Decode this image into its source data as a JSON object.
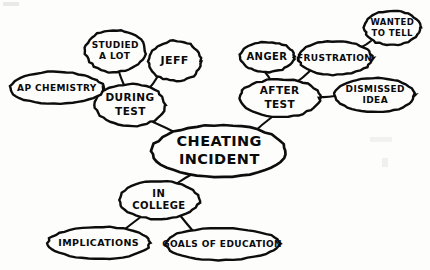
{
  "diagram": {
    "type": "mind-map",
    "style": "hand-drawn",
    "background_color": "#fdfdfc",
    "ink_color": "#0d0d0d",
    "center": {
      "id": "cheating-incident",
      "label": "CHEATING INCIDENT",
      "lines": [
        "CHEATING",
        "INCIDENT"
      ],
      "cx": 219,
      "cy": 151,
      "rx": 67,
      "ry": 26,
      "font_size": 14.5
    },
    "nodes": [
      {
        "id": "during-test",
        "label": "DURING TEST",
        "lines": [
          "DURING",
          "TEST"
        ],
        "cx": 130,
        "cy": 105,
        "rx": 35,
        "ry": 21,
        "font_size": 10.5
      },
      {
        "id": "after-test",
        "label": "AFTER TEST",
        "lines": [
          "AFTER",
          "TEST"
        ],
        "cx": 280,
        "cy": 98,
        "rx": 40,
        "ry": 19,
        "font_size": 10.5
      },
      {
        "id": "in-college",
        "label": "IN COLLEGE",
        "lines": [
          "IN",
          "COLLEGE"
        ],
        "cx": 159,
        "cy": 200,
        "rx": 40,
        "ry": 19,
        "font_size": 10
      },
      {
        "id": "ap-chemistry",
        "label": "AP CHEMISTRY",
        "lines": [
          "AP CHEMISTRY"
        ],
        "cx": 57,
        "cy": 88,
        "rx": 47,
        "ry": 16,
        "font_size": 9
      },
      {
        "id": "studied-a-lot",
        "label": "STUDIED A LOT",
        "lines": [
          "STUDIED",
          "A LOT"
        ],
        "cx": 115,
        "cy": 51,
        "rx": 30,
        "ry": 21,
        "font_size": 9
      },
      {
        "id": "jeff",
        "label": "JEFF",
        "lines": [
          "JEFF"
        ],
        "cx": 175,
        "cy": 61,
        "rx": 26,
        "ry": 20,
        "font_size": 11
      },
      {
        "id": "anger",
        "label": "ANGER",
        "lines": [
          "ANGER"
        ],
        "cx": 267,
        "cy": 57,
        "rx": 27,
        "ry": 15,
        "font_size": 10
      },
      {
        "id": "frustration",
        "label": "FRUSTRATION",
        "lines": [
          "FRUSTRATION"
        ],
        "cx": 335,
        "cy": 58,
        "rx": 37,
        "ry": 17,
        "font_size": 9
      },
      {
        "id": "wanted-to-tell",
        "label": "WANTED TO TELL",
        "lines": [
          "WANTED",
          "TO TELL"
        ],
        "cx": 392,
        "cy": 28,
        "rx": 28,
        "ry": 17,
        "font_size": 8.5
      },
      {
        "id": "dismissed-idea",
        "label": "DISMISSED IDEA",
        "lines": [
          "DISMISSED",
          "IDEA"
        ],
        "cx": 375,
        "cy": 95,
        "rx": 40,
        "ry": 17,
        "font_size": 9
      },
      {
        "id": "implications",
        "label": "IMPLICATIONS",
        "lines": [
          "IMPLICATIONS"
        ],
        "cx": 99,
        "cy": 243,
        "rx": 51,
        "ry": 16,
        "font_size": 9.5
      },
      {
        "id": "goals-of-education",
        "label": "GOALS OF EDUCATION",
        "lines": [
          "GOALS OF EDUCATION"
        ],
        "cx": 222,
        "cy": 244,
        "rx": 57,
        "ry": 16,
        "font_size": 9
      }
    ],
    "edges": [
      {
        "from": "during-test",
        "to": "cheating-incident",
        "x1": 153,
        "y1": 122,
        "x2": 178,
        "y2": 134
      },
      {
        "from": "after-test",
        "to": "cheating-incident",
        "x1": 272,
        "y1": 117,
        "x2": 253,
        "y2": 133
      },
      {
        "from": "in-college",
        "to": "cheating-incident",
        "x1": 176,
        "y1": 184,
        "x2": 196,
        "y2": 172
      },
      {
        "from": "ap-chemistry",
        "to": "during-test",
        "x1": 103,
        "y1": 92,
        "x2": 101,
        "y2": 100
      },
      {
        "from": "studied-a-lot",
        "to": "during-test",
        "x1": 119,
        "y1": 72,
        "x2": 124,
        "y2": 85
      },
      {
        "from": "jeff",
        "to": "during-test",
        "x1": 158,
        "y1": 76,
        "x2": 147,
        "y2": 91
      },
      {
        "from": "anger",
        "to": "after-test",
        "x1": 265,
        "y1": 72,
        "x2": 271,
        "y2": 81
      },
      {
        "from": "frustration",
        "to": "after-test",
        "x1": 311,
        "y1": 70,
        "x2": 294,
        "y2": 84
      },
      {
        "from": "wanted-to-tell",
        "to": "frustration",
        "x1": 371,
        "y1": 41,
        "x2": 360,
        "y2": 48
      },
      {
        "from": "dismissed-idea",
        "to": "after-test",
        "x1": 335,
        "y1": 96,
        "x2": 320,
        "y2": 97
      },
      {
        "from": "implications",
        "to": "in-college",
        "x1": 125,
        "y1": 229,
        "x2": 142,
        "y2": 216
      },
      {
        "from": "goals-of-education",
        "to": "in-college",
        "x1": 193,
        "y1": 231,
        "x2": 179,
        "y2": 214
      }
    ]
  }
}
